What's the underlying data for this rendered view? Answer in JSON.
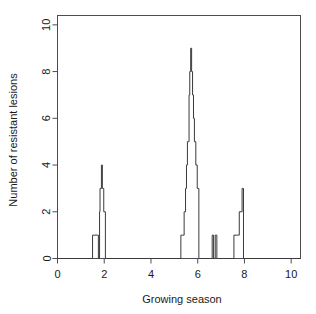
{
  "chart_data": {
    "type": "line",
    "title": "",
    "subtitle": "",
    "xlabel": "Growing season",
    "ylabel": "Number of resistant lesions",
    "xlim": [
      0,
      10.4
    ],
    "ylim": [
      0,
      10.4
    ],
    "xticks": [
      0,
      2,
      4,
      6,
      8,
      10
    ],
    "xtick_labels": [
      "0",
      "2",
      "4",
      "6",
      "8",
      "10"
    ],
    "yticks": [
      0,
      2,
      4,
      6,
      8,
      10
    ],
    "ytick_labels": [
      "0",
      "2",
      "4",
      "6",
      "8",
      "10"
    ],
    "grid": false,
    "legend": false,
    "line_style": "step",
    "series": [
      {
        "name": "resistant lesions",
        "color": "#3a3a3a",
        "x": [
          0.0,
          1.45,
          1.5,
          1.6,
          1.7,
          1.75,
          1.8,
          1.82,
          1.88,
          1.92,
          1.98,
          2.05,
          5.2,
          5.28,
          5.35,
          5.42,
          5.48,
          5.52,
          5.56,
          5.6,
          5.63,
          5.66,
          5.7,
          5.74,
          5.78,
          5.82,
          5.86,
          5.92,
          5.98,
          6.05,
          6.55,
          6.62,
          6.68,
          6.75,
          6.82,
          7.2,
          7.55,
          7.72,
          7.78,
          7.9,
          7.96,
          10.4
        ],
        "y": [
          0,
          0,
          1,
          1,
          1,
          0,
          2,
          3,
          4,
          3,
          2,
          0,
          0,
          1,
          1,
          2,
          3,
          4,
          5,
          5,
          7,
          8,
          9,
          8,
          7,
          6,
          5,
          4,
          3,
          0,
          0,
          1,
          0,
          1,
          0,
          0,
          1,
          1,
          2,
          3,
          0,
          0
        ]
      }
    ],
    "annotations": []
  },
  "axes": {
    "x_title": "Growing season",
    "y_title": "Number of resistant lesions"
  }
}
